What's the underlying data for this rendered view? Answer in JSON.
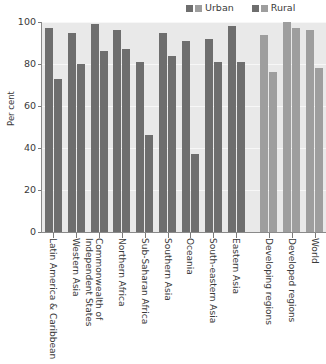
{
  "chart_data": {
    "type": "bar",
    "title": "",
    "xlabel": "",
    "ylabel": "Per cent",
    "ylim": [
      0,
      100
    ],
    "yticks": [
      0,
      20,
      40,
      60,
      80,
      100
    ],
    "grid": true,
    "legend_position": "top-right",
    "categories": [
      "Latin America & Caribbean",
      "Western Asia",
      "Commonwealth of Independent States",
      "Northern Africa",
      "Sub-Saharan Africa",
      "Southern Asia",
      "Oceania",
      "South-eastern Asia",
      "Eastern Asia",
      "Developing regions",
      "Developed regions",
      "World"
    ],
    "series": [
      {
        "name": "Urban",
        "values": [
          97,
          95,
          99,
          96,
          81,
          95,
          91,
          92,
          98,
          94,
          100,
          96
        ]
      },
      {
        "name": "Rural",
        "values": [
          73,
          80,
          86,
          87,
          46,
          84,
          37,
          81,
          81,
          76,
          97,
          78
        ]
      }
    ],
    "group_kinds": [
      "region",
      "region",
      "region",
      "region",
      "region",
      "region",
      "region",
      "region",
      "region",
      "aggregate",
      "aggregate",
      "aggregate"
    ],
    "separator_before_index": 9
  },
  "legend": {
    "entries": [
      {
        "label": "Urban",
        "swatch_dark": "#6e6e6e",
        "swatch_light": "#9e9e9e"
      },
      {
        "label": "Rural",
        "swatch_dark": "#6e6e6e",
        "swatch_light": "#9e9e9e"
      }
    ]
  },
  "colors": {
    "region_bar": "#6e6e6e",
    "aggregate_bar": "#9e9e9e",
    "plot_background": "#e9e9e9",
    "gridline": "#f7f7f7",
    "axis": "#8a8a8a",
    "text": "#3a3a3a",
    "page_background": "#ffffff"
  }
}
